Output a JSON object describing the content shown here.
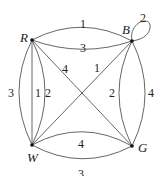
{
  "graph": {
    "vertices": [
      {
        "id": "R",
        "label": "R",
        "x": 32,
        "y": 40,
        "lx": 20,
        "ly": 42
      },
      {
        "id": "B",
        "label": "B",
        "x": 132,
        "y": 41,
        "lx": 122,
        "ly": 34
      },
      {
        "id": "W",
        "label": "W",
        "x": 32,
        "y": 145,
        "lx": 27,
        "ly": 162
      },
      {
        "id": "G",
        "label": "G",
        "x": 132,
        "y": 146,
        "lx": 138,
        "ly": 152
      }
    ],
    "edges": [
      {
        "id": "RB-1",
        "from": "R",
        "to": "B",
        "weight": "1",
        "path": "M32,40 Q82,14 132,41",
        "lx": 80,
        "ly": 28
      },
      {
        "id": "RB-3",
        "from": "R",
        "to": "B",
        "weight": "3",
        "path": "M32,40 Q82,58 132,41",
        "lx": 80,
        "ly": 52
      },
      {
        "id": "BB-2",
        "from": "B",
        "to": "B",
        "weight": "2",
        "path": "M132,41 C128,22 152,14 150,28 C149,36 140,40 132,41",
        "lx": 140,
        "ly": 22
      },
      {
        "id": "RG-4",
        "from": "R",
        "to": "G",
        "weight": "4",
        "path": "M32,40 L132,146",
        "lx": 62,
        "ly": 73
      },
      {
        "id": "BW-1",
        "from": "B",
        "to": "W",
        "weight": "1",
        "path": "M132,41 L32,145",
        "lx": 94,
        "ly": 72
      },
      {
        "id": "RW-3",
        "from": "R",
        "to": "W",
        "weight": "3",
        "path": "M32,40 Q6,92 32,145",
        "lx": 8,
        "ly": 97
      },
      {
        "id": "RW-1",
        "from": "R",
        "to": "W",
        "weight": "1",
        "path": "M32,40 L32,145",
        "lx": 35,
        "ly": 97
      },
      {
        "id": "RW-2",
        "from": "R",
        "to": "W",
        "weight": "2",
        "path": "M32,40 Q58,92 32,145",
        "lx": 45,
        "ly": 97
      },
      {
        "id": "BG-2",
        "from": "B",
        "to": "G",
        "weight": "2",
        "path": "M132,41 Q106,93 132,146",
        "lx": 109,
        "ly": 97
      },
      {
        "id": "BG-4",
        "from": "B",
        "to": "G",
        "weight": "4",
        "path": "M132,41 Q158,93 132,146",
        "lx": 148,
        "ly": 97
      },
      {
        "id": "WG-4",
        "from": "W",
        "to": "G",
        "weight": "4",
        "path": "M32,145 Q82,118 132,146",
        "lx": 78,
        "ly": 148
      },
      {
        "id": "WG-3",
        "from": "W",
        "to": "G",
        "weight": "3",
        "path": "M32,145 Q82,172 132,146",
        "lx": 78,
        "ly": 178
      }
    ]
  }
}
